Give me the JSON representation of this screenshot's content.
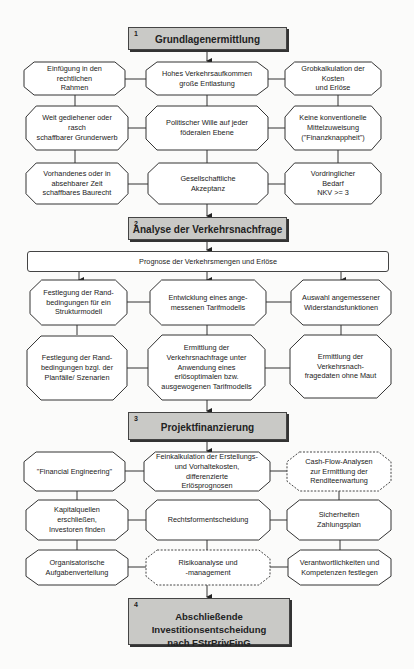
{
  "phases": [
    {
      "num": "1",
      "title": "Grundlagenermittlung"
    },
    {
      "num": "2",
      "title": "Analyse der Verkehrsnachfrage"
    },
    {
      "num": "3",
      "title": "Projektfinanzierung"
    },
    {
      "num": "4",
      "title": "Abschließende Investitionsentscheidung\nnach FStrPrivFinG"
    }
  ],
  "section1": {
    "nodes": [
      {
        "id": "einfuegung",
        "text": "Einfügung in den rechtlichen\nRahmen"
      },
      {
        "id": "verkehrsaufkommen",
        "text": "Hohes Verkehrsaufkommen\ngroße Entlastung"
      },
      {
        "id": "grobkalkulation",
        "text": "Grobkalkulation der Kosten\nund Erlöse"
      },
      {
        "id": "grunderwerb",
        "text": "Weit gediehener oder rasch\nschaffbarer Grunderwerb"
      },
      {
        "id": "politischer-wille",
        "text": "Politischer Wille auf jeder\nföderalen Ebene"
      },
      {
        "id": "mittelzuweisung",
        "text": "Keine konventionelle\nMittelzuweisung\n(\"Finanzknappheit\")"
      },
      {
        "id": "baurecht",
        "text": "Vorhandenes oder in\nabsehbarer Zeit\nschaffbares Baurecht"
      },
      {
        "id": "akzeptanz",
        "text": "Gesellschaftliche\nAkzeptanz"
      },
      {
        "id": "bedarf",
        "text": "Vordringlicher\nBedarf\nNKV >= 3"
      }
    ]
  },
  "section2": {
    "prognose": "Prognose der Verkehrsmengen und Erlöse",
    "nodes": [
      {
        "id": "randbedingungen-struktur",
        "text": "Festlegung der Rand-\nbedingungen für ein\nStrukturmodell"
      },
      {
        "id": "tarifmodell",
        "text": "Entwicklung eines ange-\nmessenen Tarifmodells"
      },
      {
        "id": "widerstandsfunktionen",
        "text": "Auswahl angemessener\nWiderstandsfunktionen"
      },
      {
        "id": "randbedingungen-planfaelle",
        "text": "Festlegung der Rand-\nbedingungen bzgl. der\nPlanfälle/ Szenarien"
      },
      {
        "id": "verkehrsnachfrage-tarif",
        "text": "Ermittlung der\nVerkehrsnachfrage unter\nAnwendung eines\nerlösoptimalen bzw.\nausgewogenen Tarifmodells"
      },
      {
        "id": "ohne-maut",
        "text": "Ermittlung der\nVerkehrsnach-\nfragedaten ohne Maut"
      }
    ]
  },
  "section3": {
    "nodes": [
      {
        "id": "financial-engineering",
        "text": "\"Financial Engineering\""
      },
      {
        "id": "feinkalkulation",
        "text": "Feinkalkulation der Erstellungs-\nund Vorhaltekosten, differenzierte\nErlösprognosen"
      },
      {
        "id": "cash-flow",
        "text": "Cash-Flow-Analysen\nzur Ermittlung der\nRenditeerwartung",
        "dashed": true
      },
      {
        "id": "kapitalquellen",
        "text": "Kapitalquellen erschließen,\nInvestoren finden"
      },
      {
        "id": "rechtsform",
        "text": "Rechtsformentscheidung"
      },
      {
        "id": "sicherheiten",
        "text": "Sicherheiten\nZahlungsplan"
      },
      {
        "id": "organisation",
        "text": "Organisatorische\nAufgabenverteilung"
      },
      {
        "id": "risikoanalyse",
        "text": "Risikoanalyse und\n-management",
        "dashed": true
      },
      {
        "id": "verantwortlichkeiten",
        "text": "Verantwortlichkeiten und\nKompetenzen festlegen"
      }
    ]
  }
}
